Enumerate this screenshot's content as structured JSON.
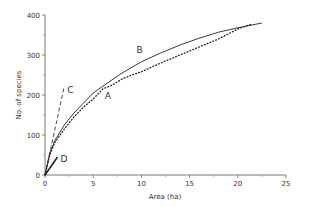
{
  "chart_data": {
    "type": "line",
    "title": "",
    "xlabel": "Area (ha)",
    "ylabel": "No. of species",
    "xlim": [
      0,
      25
    ],
    "ylim": [
      0,
      400
    ],
    "xticks": [
      0,
      5,
      10,
      15,
      20,
      25
    ],
    "yticks": [
      0,
      100,
      200,
      300,
      400
    ],
    "xtick_labels": [
      "0",
      "5",
      "10",
      "15",
      "20",
      "25"
    ],
    "ytick_labels": [
      "0",
      "100",
      "200",
      "300",
      "400"
    ],
    "grid": false,
    "legend": "none (curves labelled inline)",
    "series": [
      {
        "name": "A",
        "style": "dotted",
        "x": [
          0,
          0.5,
          1,
          2,
          3,
          4,
          5,
          6,
          7,
          8,
          9,
          10,
          12,
          14,
          16,
          18,
          20,
          21.5
        ],
        "y": [
          0,
          50,
          80,
          115,
          145,
          170,
          190,
          215,
          225,
          240,
          250,
          258,
          280,
          300,
          320,
          340,
          365,
          378
        ]
      },
      {
        "name": "B",
        "style": "solid",
        "x": [
          0,
          0.5,
          1,
          2,
          3,
          4,
          5,
          6,
          8,
          10,
          12,
          14,
          16,
          18,
          20,
          22.5
        ],
        "y": [
          0,
          55,
          85,
          125,
          155,
          180,
          205,
          222,
          255,
          283,
          305,
          325,
          342,
          357,
          368,
          380
        ]
      },
      {
        "name": "C",
        "style": "dashed",
        "x": [
          0,
          2
        ],
        "y": [
          0,
          222
        ]
      },
      {
        "name": "D",
        "style": "solid-short",
        "x": [
          0,
          1.3
        ],
        "y": [
          0,
          45
        ]
      }
    ],
    "annotations": [
      {
        "text": "A",
        "x": 6.2,
        "y": 190
      },
      {
        "text": "B",
        "x": 9.5,
        "y": 305
      },
      {
        "text": "C",
        "x": 2.3,
        "y": 205
      },
      {
        "text": "D",
        "x": 1.6,
        "y": 32
      }
    ]
  }
}
